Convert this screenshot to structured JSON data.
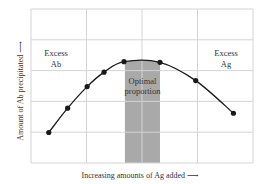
{
  "chart_data": {
    "type": "line",
    "title": "",
    "xlabel": "Increasing amounts of Ag added ⟶",
    "ylabel": "Amount of Ab precipitated ⟶",
    "grid": true,
    "grid_divisions": {
      "x": 4,
      "y": 5
    },
    "xlim": [
      0,
      1
    ],
    "ylim": [
      0,
      1
    ],
    "series": [
      {
        "name": "Precipitation curve",
        "x": [
          0.08,
          0.165,
          0.253,
          0.329,
          0.419,
          0.581,
          0.742,
          0.912
        ],
        "values": [
          0.198,
          0.356,
          0.496,
          0.59,
          0.658,
          0.654,
          0.535,
          0.323
        ]
      }
    ],
    "shaded_region": {
      "label": "Optimal proportion",
      "x_start": 0.423,
      "x_end": 0.581,
      "color": "#a9a9a9"
    },
    "annotations": [
      {
        "text_lines": [
          "Excess",
          "Ab"
        ],
        "x": 0.113,
        "y": 0.65
      },
      {
        "text_lines": [
          "Optimal",
          "proportion"
        ],
        "x": 0.5,
        "y": 0.5
      },
      {
        "text_lines": [
          "Excess",
          "Ag"
        ],
        "x": 0.887,
        "y": 0.65
      }
    ]
  },
  "labels": {
    "xlabel": "Increasing amounts of Ag added ⟶",
    "ylabel": "Amount of Ab precipitated ⟶",
    "excess_ab_1": "Excess",
    "excess_ab_2": "Ab",
    "excess_ag_1": "Excess",
    "excess_ag_2": "Ag",
    "optimal_1": "Optimal",
    "optimal_2": "proportion"
  },
  "colors": {
    "grid": "#d4d4d4",
    "band": "#a9a9a9",
    "curve": "#1a1a1a"
  }
}
